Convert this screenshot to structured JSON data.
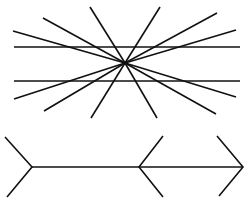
{
  "figure": {
    "colors": {
      "stroke": "#111111",
      "background": "#ffffff"
    },
    "hering": {
      "center": [
        125,
        63
      ],
      "parallel_lines": [
        {
          "x1": 14,
          "y1": 47,
          "x2": 240,
          "y2": 47
        },
        {
          "x1": 14,
          "y1": 81,
          "x2": 240,
          "y2": 81
        }
      ],
      "ray_endpoints": [
        [
          13,
          31
        ],
        [
          43,
          18
        ],
        [
          90,
          7
        ],
        [
          160,
          7
        ],
        [
          217,
          13
        ],
        [
          236,
          30
        ],
        [
          14,
          99
        ],
        [
          44,
          111
        ],
        [
          91,
          118
        ],
        [
          157,
          118
        ],
        [
          216,
          114
        ],
        [
          236,
          97
        ]
      ]
    },
    "muller_lyer": {
      "shaft": {
        "x1": 32,
        "y1": 167,
        "x2": 243,
        "y2": 167
      },
      "fins": [
        {
          "name": "left-tail-fins",
          "points": [
            [
              5,
              137
            ],
            [
              32,
              167
            ],
            [
              7,
              197
            ]
          ]
        },
        {
          "name": "middle-arrowhead-fins",
          "points": [
            [
              163,
              136
            ],
            [
              139,
              167
            ],
            [
              163,
              197
            ]
          ]
        },
        {
          "name": "right-arrowhead-fins",
          "points": [
            [
              217,
              136
            ],
            [
              243,
              167
            ],
            [
              219,
              196
            ]
          ]
        }
      ]
    }
  }
}
